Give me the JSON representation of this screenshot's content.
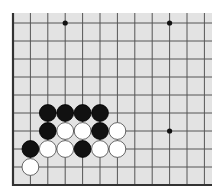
{
  "board": {
    "type": "go-board-fragment",
    "background_color": "#e3e3e3",
    "line_color": "#555555",
    "edge_color": "#333333",
    "page_color": "#ffffff",
    "columns": 12,
    "rows": 9,
    "edges": {
      "left": true,
      "bottom": true,
      "top": false,
      "right": false
    },
    "hoshi": [
      {
        "col": 3,
        "row": 0
      },
      {
        "col": 9,
        "row": 0
      },
      {
        "col": 9,
        "row": 6
      }
    ],
    "stones": [
      {
        "col": 2,
        "row": 5,
        "color": "black"
      },
      {
        "col": 3,
        "row": 5,
        "color": "black"
      },
      {
        "col": 4,
        "row": 5,
        "color": "black"
      },
      {
        "col": 5,
        "row": 5,
        "color": "black"
      },
      {
        "col": 2,
        "row": 6,
        "color": "black"
      },
      {
        "col": 3,
        "row": 6,
        "color": "white"
      },
      {
        "col": 4,
        "row": 6,
        "color": "white"
      },
      {
        "col": 5,
        "row": 6,
        "color": "black"
      },
      {
        "col": 6,
        "row": 6,
        "color": "white"
      },
      {
        "col": 1,
        "row": 7,
        "color": "black"
      },
      {
        "col": 2,
        "row": 7,
        "color": "white"
      },
      {
        "col": 3,
        "row": 7,
        "color": "white"
      },
      {
        "col": 4,
        "row": 7,
        "color": "black"
      },
      {
        "col": 5,
        "row": 7,
        "color": "white"
      },
      {
        "col": 6,
        "row": 7,
        "color": "white"
      },
      {
        "col": 1,
        "row": 8,
        "color": "white"
      }
    ],
    "stone_colors": {
      "black": {
        "fill": "#111111",
        "stroke": "#000000"
      },
      "white": {
        "fill": "#ffffff",
        "stroke": "#444444"
      }
    }
  }
}
